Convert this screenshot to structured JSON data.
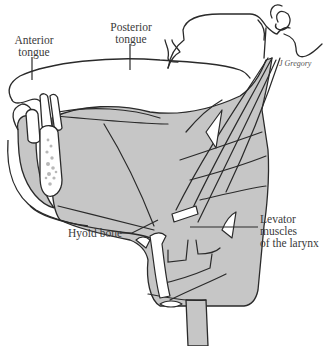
{
  "figure": {
    "colors": {
      "muscle_fill": "#c6c6c6",
      "outline": "#2a2a2a",
      "bone_fill": "#ffffff",
      "label_text": "#3a3a3a"
    },
    "labels": {
      "anterior_tongue": "Anterior\ntongue",
      "posterior_tongue": "Posterior\ntongue",
      "hyoid_bone": "Hyoid bone",
      "levator_muscles": "Levator\nmuscles\nof the larynx"
    },
    "credit": "J Gregory"
  }
}
